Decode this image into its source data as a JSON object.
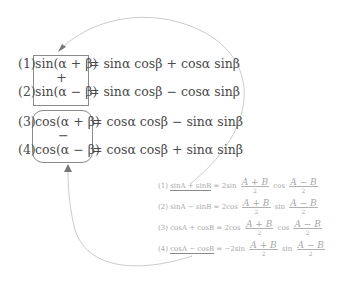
{
  "sum_to_product_group": {
    "equations": [
      {
        "label": "(1)",
        "lhs": "sin(α + β)",
        "rhs": "= sinα cosβ + cosα sinβ"
      },
      {
        "label": "(2)",
        "lhs": "sin(α − β)",
        "rhs": "= sinα cosβ − cosα sinβ"
      },
      {
        "label": "(3)",
        "lhs": "cos(α + β)",
        "rhs": "= cosα cosβ − sinα sinβ"
      },
      {
        "label": "(4)",
        "lhs": "cos(α − β)",
        "rhs": "= cosα cosβ + sinα sinβ"
      }
    ],
    "operator_sin_box": "+",
    "operator_cos_box": "−"
  },
  "product_formulas": [
    {
      "label": "(1)",
      "lhs": "sinA + sinB",
      "eq": "= 2sin",
      "frac1_num": "A + B",
      "frac1_den": "2",
      "mid": "cos",
      "frac2_num": "A − B",
      "frac2_den": "2"
    },
    {
      "label": "(2)",
      "lhs": "sinA − sinB",
      "eq": "= 2cos",
      "frac1_num": "A + B",
      "frac1_den": "2",
      "mid": "sin",
      "frac2_num": "A − B",
      "frac2_den": "2"
    },
    {
      "label": "(3)",
      "lhs": "cosA + cosB",
      "eq": "= 2cos",
      "frac1_num": "A + B",
      "frac1_den": "2",
      "mid": "cos",
      "frac2_num": "A − B",
      "frac2_den": "2"
    },
    {
      "label": "(4)",
      "lhs": "cosA − cosB",
      "eq": "= −2sin",
      "frac1_num": "A + B",
      "frac1_den": "2",
      "mid": "sin",
      "frac2_num": "A − B",
      "frac2_den": "2"
    }
  ],
  "colors": {
    "main_text": "#4a4a4a",
    "faded_text": "#a8a8a8",
    "box_border": "#8a8a8a",
    "arrow": "#b8b8b8"
  }
}
